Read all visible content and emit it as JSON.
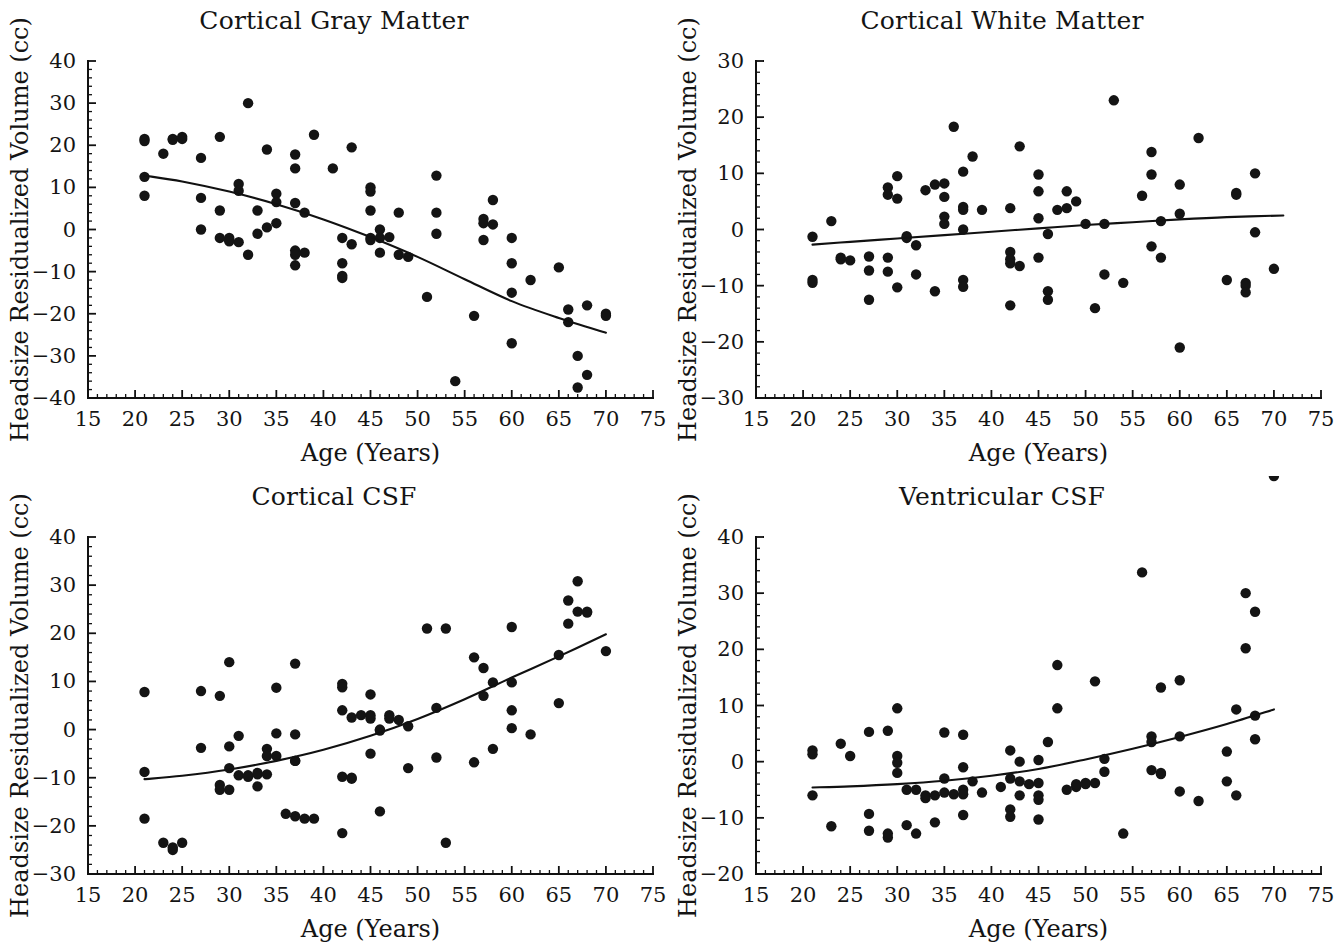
{
  "figure": {
    "background": "#ffffff",
    "point_color": "#141414",
    "curve_color": "#111111",
    "panel_count": 4
  },
  "chart_data": [
    {
      "type": "scatter",
      "title": "Cortical Gray Matter",
      "xlabel": "Age (Years)",
      "ylabel": "Headsize Residualized Volume (cc)",
      "xlim": [
        15,
        75
      ],
      "ylim": [
        -40,
        40
      ],
      "xticks": [
        15,
        20,
        25,
        30,
        35,
        40,
        45,
        50,
        55,
        60,
        65,
        70,
        75
      ],
      "yticks": [
        -40,
        -30,
        -20,
        -10,
        0,
        10,
        20,
        30,
        40
      ],
      "xtick_labels": [
        "15",
        "20",
        "25",
        "30",
        "35",
        "40",
        "45",
        "50",
        "55",
        "60",
        "65",
        "70",
        "75"
      ],
      "ytick_labels": [
        "−40",
        "−30",
        "−20",
        "−10",
        "0",
        "10",
        "20",
        "30",
        "40"
      ],
      "grid": false,
      "legend": "none",
      "x": [
        21,
        21,
        21,
        21,
        23,
        24,
        24,
        25,
        25,
        27,
        27,
        27,
        29,
        29,
        29,
        30,
        30,
        30,
        31,
        31,
        31,
        32,
        32,
        33,
        33,
        34,
        34,
        35,
        35,
        35,
        37,
        37,
        37,
        37,
        37,
        37,
        38,
        38,
        39,
        41,
        42,
        42,
        42,
        42,
        43,
        43,
        45,
        45,
        45,
        45,
        45,
        46,
        46,
        46,
        47,
        48,
        48,
        49,
        51,
        52,
        52,
        52,
        54,
        56,
        57,
        57,
        57,
        58,
        58,
        60,
        60,
        60,
        60,
        62,
        65,
        66,
        66,
        67,
        67,
        68,
        68,
        70,
        70
      ],
      "y": [
        21.5,
        21,
        12.5,
        8,
        18,
        21.5,
        21.3,
        22,
        21.5,
        17,
        7.5,
        0,
        22,
        4.5,
        -2,
        -2.5,
        -2,
        -2.8,
        10.8,
        9.2,
        -3,
        30,
        -6,
        4.5,
        -1,
        19,
        0.5,
        8.5,
        6.5,
        1.5,
        17.8,
        14.5,
        6.3,
        -5,
        -6,
        -8.5,
        4,
        -5.5,
        22.5,
        14.5,
        -2,
        -8,
        -11.5,
        -11,
        19.5,
        -3.5,
        10,
        9,
        4.5,
        -2,
        -2.5,
        0,
        -2,
        -5.5,
        -1.8,
        4,
        -6,
        -6.5,
        -16,
        12.8,
        4,
        -1,
        -36,
        -20.5,
        2.5,
        1.5,
        -2.5,
        7,
        1.2,
        -2,
        -8,
        -15,
        -27,
        -12,
        -9,
        -22,
        -19,
        -37.5,
        -30,
        -34.5,
        -18,
        -20,
        -20.5
      ],
      "fit": {
        "kind": "quadratic",
        "x_start": 21,
        "x_end": 70,
        "points_x": [
          21,
          25,
          30,
          35,
          40,
          45,
          50,
          55,
          60,
          65,
          70
        ],
        "points_y": [
          12.8,
          11.4,
          9.0,
          6.0,
          2.4,
          -1.8,
          -6.5,
          -11.8,
          -17.0,
          -21.0,
          -24.5
        ]
      }
    },
    {
      "type": "scatter",
      "title": "Cortical White Matter",
      "xlabel": "Age (Years)",
      "ylabel": "Headsize Residualized Volume (cc)",
      "xlim": [
        15,
        75
      ],
      "ylim": [
        -30,
        30
      ],
      "xticks": [
        15,
        20,
        25,
        30,
        35,
        40,
        45,
        50,
        55,
        60,
        65,
        70,
        75
      ],
      "yticks": [
        -30,
        -20,
        -10,
        0,
        10,
        20,
        30
      ],
      "xtick_labels": [
        "15",
        "20",
        "25",
        "30",
        "35",
        "40",
        "45",
        "50",
        "55",
        "60",
        "65",
        "70",
        "75"
      ],
      "ytick_labels": [
        "−30",
        "−20",
        "−10",
        "0",
        "10",
        "20",
        "30"
      ],
      "grid": false,
      "legend": "none",
      "x": [
        21,
        21,
        21,
        23,
        24,
        24,
        25,
        27,
        27,
        27,
        29,
        29,
        29,
        29,
        30,
        30,
        30,
        31,
        31,
        32,
        32,
        33,
        34,
        34,
        35,
        35,
        35,
        35,
        36,
        37,
        37,
        37,
        37,
        37,
        37,
        38,
        39,
        42,
        42,
        42,
        42,
        42,
        43,
        43,
        45,
        45,
        45,
        45,
        46,
        46,
        46,
        47,
        48,
        48,
        49,
        50,
        51,
        52,
        52,
        53,
        54,
        56,
        57,
        57,
        57,
        58,
        58,
        60,
        60,
        60,
        62,
        65,
        66,
        66,
        67,
        67,
        67,
        68,
        68,
        70
      ],
      "y": [
        -1.3,
        -9,
        -9.5,
        1.5,
        -5,
        -5.3,
        -5.5,
        -4.8,
        -7.3,
        -12.5,
        7.5,
        6.2,
        -5,
        -7.5,
        9.5,
        5.5,
        -10.3,
        -1.2,
        -1.5,
        -2.8,
        -8,
        7,
        8,
        -11,
        1,
        2.3,
        8.2,
        5.8,
        18.3,
        10.3,
        4,
        3.5,
        0,
        -9,
        -10.2,
        13,
        3.5,
        3.8,
        -4,
        -5.3,
        -6,
        -13.5,
        14.8,
        -6.5,
        9.8,
        6.8,
        2,
        -5,
        -0.8,
        -11,
        -12.5,
        3.5,
        6.8,
        3.8,
        5,
        1,
        -14,
        1,
        -8,
        23,
        -9.5,
        6,
        13.8,
        9.8,
        -3,
        -5,
        1.5,
        8,
        2.8,
        -21,
        16.3,
        -9,
        6.5,
        6.2,
        -9.5,
        -10,
        -11.2,
        10,
        -0.5,
        -7
      ],
      "fit": {
        "kind": "quadratic",
        "x_start": 21,
        "x_end": 71,
        "points_x": [
          21,
          25,
          30,
          35,
          40,
          45,
          50,
          55,
          60,
          65,
          71
        ],
        "points_y": [
          -2.7,
          -2.2,
          -1.6,
          -1.0,
          -0.4,
          0.2,
          0.8,
          1.3,
          1.8,
          2.2,
          2.5
        ]
      }
    },
    {
      "type": "scatter",
      "title": "Cortical CSF",
      "xlabel": "Age (Years)",
      "ylabel": "Headsize Residualized Volume (cc)",
      "xlim": [
        15,
        75
      ],
      "ylim": [
        -30,
        40
      ],
      "xticks": [
        15,
        20,
        25,
        30,
        35,
        40,
        45,
        50,
        55,
        60,
        65,
        70,
        75
      ],
      "yticks": [
        -30,
        -20,
        -10,
        0,
        10,
        20,
        30,
        40
      ],
      "xtick_labels": [
        "15",
        "20",
        "25",
        "30",
        "35",
        "40",
        "45",
        "50",
        "55",
        "60",
        "65",
        "70",
        "75"
      ],
      "ytick_labels": [
        "−30",
        "−20",
        "−10",
        "0",
        "10",
        "20",
        "30",
        "40"
      ],
      "grid": false,
      "legend": "none",
      "x": [
        21,
        21,
        21,
        23,
        24,
        24,
        25,
        27,
        27,
        29,
        29,
        29,
        30,
        30,
        30,
        30,
        31,
        31,
        32,
        32,
        33,
        33,
        33,
        34,
        34,
        34,
        35,
        35,
        35,
        36,
        37,
        37,
        37,
        37,
        37,
        38,
        39,
        42,
        42,
        42,
        42,
        42,
        43,
        43,
        43,
        44,
        45,
        45,
        45,
        45,
        46,
        46,
        46,
        47,
        47,
        48,
        49,
        49,
        51,
        52,
        52,
        53,
        53,
        56,
        56,
        57,
        57,
        58,
        58,
        60,
        60,
        60,
        60,
        62,
        65,
        65,
        66,
        66,
        67,
        67,
        68,
        68,
        70
      ],
      "y": [
        7.8,
        -8.8,
        -18.5,
        -23.5,
        -25,
        -24.5,
        -23.5,
        8,
        -3.8,
        7,
        -11.5,
        -12.5,
        14,
        -3.5,
        -8,
        -12.5,
        -1.3,
        -9.5,
        -9.8,
        -9.5,
        -9,
        -9.3,
        -11.8,
        -4,
        -5.5,
        -9.3,
        8.7,
        -5.5,
        -0.8,
        -17.5,
        13.7,
        -1,
        -6.5,
        -6.5,
        -18,
        -18.5,
        -18.5,
        9.5,
        8.8,
        4,
        -9.8,
        -21.5,
        2.5,
        -10,
        -10.2,
        3,
        7.3,
        3,
        2.3,
        -5,
        -0.2,
        -17,
        0,
        3,
        2.3,
        2,
        -8,
        0.7,
        21,
        4.5,
        -5.8,
        -23.5,
        21,
        15,
        -6.8,
        12.8,
        7,
        -4,
        9.8,
        21.3,
        9.8,
        4,
        0.3,
        -1,
        15.5,
        5.5,
        22,
        26.8,
        24.5,
        30.8,
        24.3,
        24.5,
        16.3
      ],
      "fit": {
        "kind": "quadratic",
        "x_start": 21,
        "x_end": 70,
        "points_x": [
          21,
          25,
          30,
          35,
          40,
          45,
          50,
          55,
          60,
          65,
          70
        ],
        "points_y": [
          -10.3,
          -9.6,
          -8.3,
          -6.5,
          -4.2,
          -1.3,
          2.2,
          6.3,
          10.8,
          15.2,
          19.8
        ]
      }
    },
    {
      "type": "scatter",
      "title": "Ventricular CSF",
      "xlabel": "Age (Years)",
      "ylabel": "Headsize Residualized Volume (cc)",
      "xlim": [
        15,
        75
      ],
      "ylim": [
        -20,
        40
      ],
      "xticks": [
        15,
        20,
        25,
        30,
        35,
        40,
        45,
        50,
        55,
        60,
        65,
        70,
        75
      ],
      "yticks": [
        -20,
        -10,
        0,
        10,
        20,
        30,
        40
      ],
      "xtick_labels": [
        "15",
        "20",
        "25",
        "30",
        "35",
        "40",
        "45",
        "50",
        "55",
        "60",
        "65",
        "70",
        "75"
      ],
      "ytick_labels": [
        "−20",
        "−10",
        "0",
        "10",
        "20",
        "30",
        "40"
      ],
      "grid": false,
      "legend": "none",
      "x": [
        21,
        21,
        21,
        23,
        24,
        25,
        27,
        27,
        27,
        29,
        29,
        29,
        30,
        30,
        30,
        30,
        31,
        31,
        32,
        32,
        33,
        33,
        34,
        34,
        35,
        35,
        35,
        36,
        37,
        37,
        37,
        37,
        37,
        38,
        39,
        41,
        42,
        42,
        42,
        42,
        43,
        43,
        43,
        44,
        45,
        45,
        45,
        45,
        45,
        46,
        47,
        47,
        48,
        49,
        49,
        50,
        50,
        51,
        51,
        52,
        52,
        54,
        56,
        57,
        57,
        57,
        58,
        58,
        58,
        60,
        60,
        60,
        62,
        65,
        65,
        66,
        66,
        67,
        67,
        68,
        68,
        68,
        70
      ],
      "y": [
        2,
        1.3,
        -6,
        -11.5,
        3.2,
        1,
        5.3,
        -9.3,
        -12.3,
        5.5,
        -13.5,
        -12.8,
        9.5,
        1,
        -0.2,
        -2,
        -5,
        -11.3,
        -5,
        -12.8,
        -6.5,
        -6,
        -6,
        -10.8,
        5.2,
        -3,
        -5.5,
        -5.8,
        4.8,
        -1,
        -5,
        -5.8,
        -9.5,
        -3.5,
        -5.5,
        -4.5,
        2,
        -3,
        -8.5,
        -9.8,
        0,
        -6,
        -3.5,
        -4,
        0.3,
        -3.8,
        -6,
        -6.8,
        -10.3,
        3.5,
        17.2,
        9.5,
        -5,
        -4.5,
        -4,
        -3.8,
        -4,
        14.3,
        -3.8,
        0.5,
        -1.8,
        -12.8,
        33.7,
        4.5,
        3.5,
        -1.5,
        13.2,
        -2,
        -2.2,
        14.5,
        4.5,
        -5.3,
        -7,
        -3.5,
        1.8,
        -6,
        9.3,
        30,
        20.2,
        26.7,
        8.2,
        4
      ],
      "fit": {
        "kind": "quadratic",
        "x_start": 21,
        "x_end": 70,
        "points_x": [
          21,
          25,
          30,
          35,
          40,
          45,
          50,
          55,
          60,
          65,
          70
        ],
        "points_y": [
          -4.6,
          -4.4,
          -4.0,
          -3.4,
          -2.5,
          -1.3,
          0.4,
          2.3,
          4.4,
          6.7,
          9.3
        ]
      }
    }
  ]
}
